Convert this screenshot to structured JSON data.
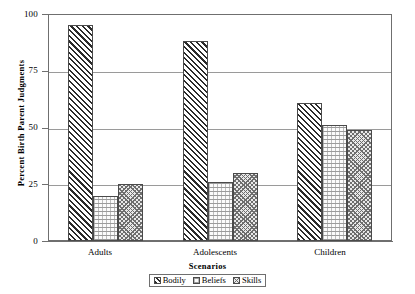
{
  "chart_data": {
    "type": "bar",
    "title": "",
    "subtitle": "",
    "xlabel": "Scenarios",
    "ylabel": "Percent Birth Parent Judgments",
    "categories": [
      "Adults",
      "Adolescents",
      "Children"
    ],
    "series": [
      {
        "name": "Bodily",
        "values": [
          95,
          88,
          61
        ],
        "pattern": "diagonal-hatch"
      },
      {
        "name": "Beliefs",
        "values": [
          20,
          26,
          51
        ],
        "pattern": "light-dotted-brick"
      },
      {
        "name": "Skills",
        "values": [
          25,
          30,
          49
        ],
        "pattern": "cross-hatch-checker"
      }
    ],
    "ylim": [
      0,
      100
    ],
    "yticks": [
      0,
      25,
      50,
      75,
      100
    ],
    "ytick_labels": [
      "0",
      "25",
      "50",
      "75",
      "100"
    ],
    "grid": true,
    "grid_axis": "y",
    "legend_position": "bottom",
    "bar_group_spacing": "grouped-adjacent",
    "colors": {
      "axis": "#6f6f6f",
      "gridline": "#9a9a9a",
      "bar_outline": "#4a4a4a",
      "text": "#000000",
      "background": "#ffffff"
    }
  },
  "axis": {
    "y_title": "Percent Birth Parent Judgments",
    "x_title": "Scenarios",
    "y_ticks": [
      {
        "label": "100",
        "value": 100
      },
      {
        "label": "75",
        "value": 75
      },
      {
        "label": "50",
        "value": 50
      },
      {
        "label": "25",
        "value": 25
      },
      {
        "label": "0",
        "value": 0
      }
    ],
    "x_categories": [
      {
        "label": "Adults"
      },
      {
        "label": "Adolescents"
      },
      {
        "label": "Children"
      }
    ]
  },
  "legend": {
    "entries": [
      {
        "label": "Bodily"
      },
      {
        "label": "Beliefs"
      },
      {
        "label": "Skills"
      }
    ]
  }
}
